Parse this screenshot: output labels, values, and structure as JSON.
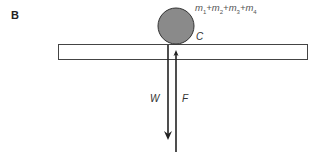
{
  "panel_label": "B",
  "mass_label": {
    "parts": [
      "m",
      "1",
      "+m",
      "2",
      "+m",
      "3",
      "+m",
      "4"
    ],
    "text": "m1+m2+m3+m4"
  },
  "contact_point_label": "C",
  "forces": {
    "weight": "W",
    "normal": "F"
  },
  "colors": {
    "ball_fill": "#8a8a8a",
    "ball_stroke": "#333333",
    "line": "#222222"
  }
}
